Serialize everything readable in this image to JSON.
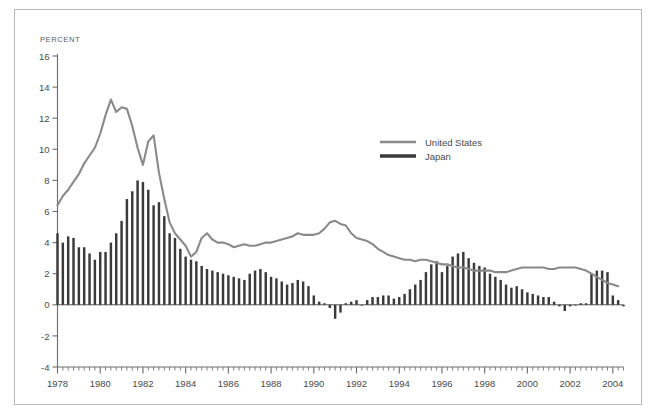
{
  "figure": {
    "unit_label": "PERCENT",
    "border_color": "#b9b9b9",
    "background": "#ffffff"
  },
  "legend": {
    "position": "upper-right-inside",
    "entries": [
      {
        "label": "United States",
        "color": "#8a8a8a",
        "style": "line"
      },
      {
        "label": "Japan",
        "color": "#3a3a3a",
        "style": "bar"
      }
    ]
  },
  "axes": {
    "y": {
      "label": "PERCENT",
      "ticks": [
        "16",
        "14",
        "12",
        "10",
        "8",
        "6",
        "4",
        "2",
        "0",
        "-2",
        "-4"
      ],
      "min": -4,
      "max": 16,
      "tick_step": 2,
      "zero_line": true
    },
    "x": {
      "ticks": [
        "1978",
        "1980",
        "1982",
        "1984",
        "1986",
        "1988",
        "1990",
        "1992",
        "1994",
        "1996",
        "1998",
        "2000",
        "2002",
        "2004"
      ],
      "min": 1978,
      "max": 2004.5,
      "tick_step": 2,
      "minor_tick_step": 0.25
    }
  },
  "chart_data": {
    "type": "line",
    "title": "",
    "subtitle": "",
    "xlabel": "",
    "ylabel": "PERCENT",
    "xlim": [
      1978,
      2004.5
    ],
    "ylim": [
      -4,
      16
    ],
    "grid": false,
    "legend_position": "upper right",
    "x_tick_labels": [
      "1978",
      "1980",
      "1982",
      "1984",
      "1986",
      "1988",
      "1990",
      "1992",
      "1994",
      "1996",
      "1998",
      "2000",
      "2002",
      "2004"
    ],
    "y_tick_labels": [
      "16",
      "14",
      "12",
      "10",
      "8",
      "6",
      "4",
      "2",
      "0",
      "-2",
      "-4"
    ],
    "x_start": 1978.0,
    "x_step": 0.25,
    "series": [
      {
        "name": "United States",
        "type": "line",
        "color": "#8a8a8a",
        "values": [
          6.4,
          7.0,
          7.4,
          7.9,
          8.4,
          9.1,
          9.6,
          10.1,
          11.0,
          12.2,
          13.2,
          12.4,
          12.7,
          12.6,
          11.5,
          10.1,
          9.0,
          10.5,
          10.9,
          8.5,
          6.8,
          5.3,
          4.6,
          4.2,
          3.8,
          3.1,
          3.4,
          4.3,
          4.6,
          4.2,
          4.0,
          4.0,
          3.9,
          3.7,
          3.8,
          3.9,
          3.8,
          3.8,
          3.9,
          4.0,
          4.0,
          4.1,
          4.2,
          4.3,
          4.4,
          4.6,
          4.5,
          4.5,
          4.5,
          4.6,
          4.9,
          5.3,
          5.4,
          5.2,
          5.1,
          4.6,
          4.3,
          4.2,
          4.1,
          3.9,
          3.6,
          3.4,
          3.2,
          3.1,
          3.0,
          2.9,
          2.9,
          2.8,
          2.9,
          2.9,
          2.8,
          2.7,
          2.6,
          2.6,
          2.5,
          2.4,
          2.4,
          2.3,
          2.2,
          2.2,
          2.2,
          2.2,
          2.1,
          2.1,
          2.1,
          2.2,
          2.3,
          2.4,
          2.4,
          2.4,
          2.4,
          2.4,
          2.3,
          2.3,
          2.4,
          2.4,
          2.4,
          2.4,
          2.3,
          2.2,
          2.0,
          1.8,
          1.6,
          1.4,
          1.3,
          1.2
        ]
      },
      {
        "name": "Japan",
        "type": "bar",
        "color": "#3a3a3a",
        "values": [
          4.6,
          4.0,
          4.4,
          4.3,
          3.7,
          3.7,
          3.3,
          2.9,
          3.4,
          3.4,
          4.0,
          4.6,
          5.4,
          6.8,
          7.3,
          8.0,
          7.9,
          7.4,
          6.4,
          6.6,
          5.7,
          4.6,
          4.3,
          3.6,
          3.1,
          2.9,
          2.8,
          2.5,
          2.3,
          2.2,
          2.1,
          2.0,
          1.9,
          1.8,
          1.7,
          1.6,
          2.0,
          2.2,
          2.3,
          2.1,
          1.8,
          1.7,
          1.5,
          1.3,
          1.4,
          1.6,
          1.5,
          1.2,
          0.6,
          0.2,
          0.1,
          -0.2,
          -0.9,
          -0.5,
          0.1,
          0.2,
          0.3,
          0.0,
          0.3,
          0.5,
          0.5,
          0.6,
          0.6,
          0.4,
          0.5,
          0.7,
          1.0,
          1.3,
          1.6,
          2.1,
          2.6,
          2.8,
          2.1,
          2.5,
          3.1,
          3.3,
          3.4,
          3.0,
          2.7,
          2.5,
          2.4,
          2.0,
          1.8,
          1.6,
          1.3,
          1.1,
          1.2,
          1.0,
          0.8,
          0.7,
          0.6,
          0.5,
          0.5,
          0.2,
          -0.1,
          -0.4,
          -0.1,
          0.0,
          0.1,
          0.1,
          2.0,
          2.2,
          2.2,
          2.1,
          0.6,
          0.3,
          -0.1,
          -0.4,
          -0.3,
          -0.5,
          -0.3,
          -0.6,
          -0.7,
          -0.6,
          -0.8,
          -0.7,
          -0.8,
          -1.0,
          -1.1,
          -1.3,
          -1.1,
          -1.0,
          -0.8,
          -0.6,
          -0.4,
          -0.3,
          -0.2,
          -0.2,
          -0.1,
          -0.1
        ]
      }
    ]
  }
}
